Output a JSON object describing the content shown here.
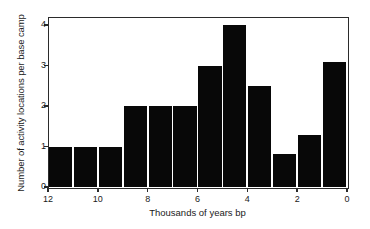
{
  "chart_data": {
    "type": "bar",
    "title": "",
    "subtitle": "",
    "xlabel": "Thousands of years bp",
    "ylabel": "Number of activity locations per base camp",
    "xlim": [
      12,
      0
    ],
    "ylim": [
      0,
      4.2
    ],
    "x_tick_labels": [
      "12",
      "10",
      "8",
      "6",
      "4",
      "2",
      "0"
    ],
    "x_tick_values": [
      12,
      10,
      8,
      6,
      4,
      2,
      0
    ],
    "y_tick_labels": [
      "0",
      "1",
      "2",
      "3",
      "4"
    ],
    "y_tick_values": [
      0,
      1,
      2,
      3,
      4
    ],
    "x_axis_reversed": true,
    "grid": false,
    "legend": null,
    "bar_color": "#080808",
    "axis_color": "#2b2b2b",
    "background_color": "#ffffff",
    "bin_width": 1,
    "bins": [
      {
        "label": "12–11",
        "bin_start": 12,
        "bin_end": 11,
        "value": 1.0
      },
      {
        "label": "11–10",
        "bin_start": 11,
        "bin_end": 10,
        "value": 1.0
      },
      {
        "label": "10–9",
        "bin_start": 10,
        "bin_end": 9,
        "value": 1.0
      },
      {
        "label": "9–8",
        "bin_start": 9,
        "bin_end": 8,
        "value": 2.0
      },
      {
        "label": "8–7",
        "bin_start": 8,
        "bin_end": 7,
        "value": 2.0
      },
      {
        "label": "7–6",
        "bin_start": 7,
        "bin_end": 6,
        "value": 2.0
      },
      {
        "label": "6–5",
        "bin_start": 6,
        "bin_end": 5,
        "value": 3.0
      },
      {
        "label": "5–4",
        "bin_start": 5,
        "bin_end": 4,
        "value": 4.0
      },
      {
        "label": "4–3",
        "bin_start": 4,
        "bin_end": 3,
        "value": 2.5
      },
      {
        "label": "3–2",
        "bin_start": 3,
        "bin_end": 2,
        "value": 0.82
      },
      {
        "label": "2–1",
        "bin_start": 2,
        "bin_end": 1,
        "value": 1.29
      },
      {
        "label": "1–0",
        "bin_start": 1,
        "bin_end": 0,
        "value": 3.1
      }
    ],
    "categories": [
      "12–11",
      "11–10",
      "10–9",
      "9–8",
      "8–7",
      "7–6",
      "6–5",
      "5–4",
      "4–3",
      "3–2",
      "2–1",
      "1–0"
    ],
    "values": [
      1.0,
      1.0,
      1.0,
      2.0,
      2.0,
      2.0,
      3.0,
      4.0,
      2.5,
      0.82,
      1.29,
      3.1
    ]
  }
}
